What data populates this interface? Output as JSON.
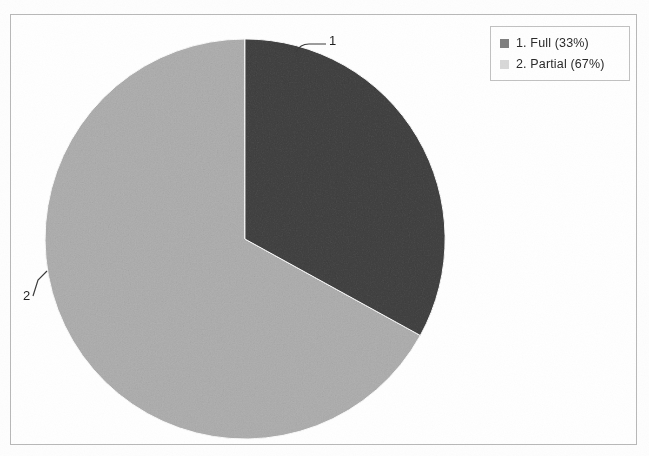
{
  "chart_data": {
    "type": "pie",
    "title": "",
    "categories": [
      "1. Full",
      "2. Partial"
    ],
    "values": [
      33,
      67
    ],
    "value_unit": "%",
    "legend_position": "top-right",
    "grid": false,
    "slice_labels": [
      "1",
      "2"
    ],
    "colors": [
      "#808080",
      "#d4d4d4"
    ],
    "start_angle_deg": 0,
    "direction": "clockwise"
  },
  "legend": {
    "items": [
      {
        "label": "1. Full (33%)",
        "swatch_color": "#808080"
      },
      {
        "label": "2. Partial (67%)",
        "swatch_color": "#d9d9d9"
      }
    ]
  },
  "callouts": {
    "slice1": "1",
    "slice2": "2"
  },
  "colors": {
    "slice_dark": "#808080",
    "slice_light": "#d4d4d4",
    "frame_border": "#b9b9b9",
    "legend_border": "#c2c2c2",
    "leader_line": "#3c3c3c",
    "background": "#ffffff"
  }
}
